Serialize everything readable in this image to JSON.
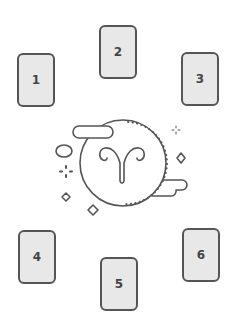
{
  "spread": {
    "cards": [
      {
        "label": "1",
        "x": 17,
        "y": 53
      },
      {
        "label": "2",
        "x": 99,
        "y": 25
      },
      {
        "label": "3",
        "x": 181,
        "y": 52
      },
      {
        "label": "4",
        "x": 18,
        "y": 230
      },
      {
        "label": "5",
        "x": 100,
        "y": 257
      },
      {
        "label": "6",
        "x": 182,
        "y": 228
      }
    ]
  },
  "illustration": {
    "symbol": "aries-zodiac-icon",
    "stroke_color": "#555555",
    "card_fill": "#e8e8e8"
  }
}
